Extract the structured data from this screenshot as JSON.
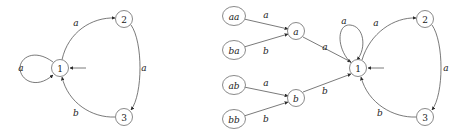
{
  "figure": {
    "type": "finite-automaton-diagram",
    "background_color": "#ffffff",
    "node_stroke_color": "#6b6b6b",
    "edge_color": "#4d4d4d",
    "text_color": "#1a1a1a"
  },
  "left_automaton": {
    "name": "left-automaton",
    "nodes": [
      {
        "id": "n1",
        "label": "1",
        "cx": 60,
        "cy": 68,
        "r": 8.5,
        "italic": false,
        "start": true
      },
      {
        "id": "n2",
        "label": "2",
        "cx": 124,
        "cy": 19,
        "r": 8.5,
        "italic": false,
        "start": false
      },
      {
        "id": "n3",
        "label": "3",
        "cx": 124,
        "cy": 117,
        "r": 8.5,
        "italic": false,
        "start": false
      }
    ],
    "edges": [
      {
        "from": "n1",
        "to": "n1",
        "label": "a",
        "kind": "self-loop-left",
        "label_x": 21,
        "label_y": 68
      },
      {
        "from": "n1",
        "to": "n2",
        "label": "a",
        "kind": "curve-up",
        "label_x": 76,
        "label_y": 23
      },
      {
        "from": "n2",
        "to": "n3",
        "label": "a",
        "kind": "curve-right",
        "label_x": 144,
        "label_y": 68
      },
      {
        "from": "n3",
        "to": "n1",
        "label": "b",
        "kind": "curve-down",
        "label_x": 76,
        "label_y": 113
      }
    ],
    "start_marker": {
      "label": "start-arrow",
      "x1": 70,
      "y1": 68,
      "x2": 86,
      "y2": 68
    }
  },
  "right_automaton": {
    "name": "right-automaton",
    "nodes": [
      {
        "id": "aa",
        "label": "aa",
        "cx": 234,
        "cy": 16,
        "r": 10.5,
        "italic": true,
        "start": false
      },
      {
        "id": "ba",
        "label": "ba",
        "cx": 234,
        "cy": 50,
        "r": 10.5,
        "italic": true,
        "start": false
      },
      {
        "id": "ab",
        "label": "ab",
        "cx": 234,
        "cy": 85,
        "r": 10.5,
        "italic": true,
        "start": false
      },
      {
        "id": "bb",
        "label": "bb",
        "cx": 234,
        "cy": 119,
        "r": 10.5,
        "italic": true,
        "start": false
      },
      {
        "id": "a",
        "label": "a",
        "cx": 296,
        "cy": 31,
        "r": 8.5,
        "italic": true,
        "start": false
      },
      {
        "id": "b",
        "label": "b",
        "cx": 296,
        "cy": 98,
        "r": 8.5,
        "italic": true,
        "start": false
      },
      {
        "id": "r1",
        "label": "1",
        "cx": 358,
        "cy": 68,
        "r": 8.5,
        "italic": false,
        "start": true
      },
      {
        "id": "r2",
        "label": "2",
        "cx": 425,
        "cy": 19,
        "r": 8.5,
        "italic": false,
        "start": false
      },
      {
        "id": "r3",
        "label": "3",
        "cx": 425,
        "cy": 117,
        "r": 8.5,
        "italic": false,
        "start": false
      }
    ],
    "edges": [
      {
        "from": "aa",
        "to": "a",
        "label": "a",
        "kind": "straight",
        "label_x": 266,
        "label_y": 15
      },
      {
        "from": "ba",
        "to": "a",
        "label": "b",
        "kind": "straight",
        "label_x": 266,
        "label_y": 50
      },
      {
        "from": "ab",
        "to": "b",
        "label": "a",
        "kind": "straight",
        "label_x": 266,
        "label_y": 83
      },
      {
        "from": "bb",
        "to": "b",
        "label": "b",
        "kind": "straight",
        "label_x": 266,
        "label_y": 119
      },
      {
        "from": "a",
        "to": "r1",
        "label": "a",
        "kind": "straight",
        "label_x": 325,
        "label_y": 47
      },
      {
        "from": "b",
        "to": "r1",
        "label": "b",
        "kind": "straight",
        "label_x": 325,
        "label_y": 91
      },
      {
        "from": "r1",
        "to": "r1",
        "label": "a",
        "kind": "self-loop-up",
        "label_x": 344,
        "label_y": 22
      },
      {
        "from": "r1",
        "to": "r2",
        "label": "a",
        "kind": "curve-up",
        "label_x": 376,
        "label_y": 23
      },
      {
        "from": "r2",
        "to": "r3",
        "label": "a",
        "kind": "curve-right",
        "label_x": 446,
        "label_y": 68
      },
      {
        "from": "r3",
        "to": "r1",
        "label": "b",
        "kind": "curve-down",
        "label_x": 380,
        "label_y": 113
      }
    ],
    "start_marker": {
      "label": "start-arrow",
      "x1": 368,
      "y1": 68,
      "x2": 384,
      "y2": 68
    }
  }
}
